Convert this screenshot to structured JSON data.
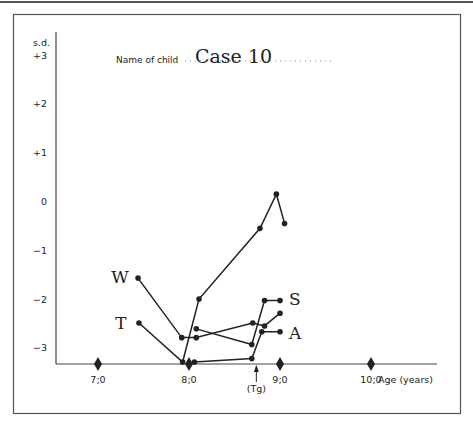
{
  "header": {
    "name_label": "Name of child",
    "name_value": "Case 10"
  },
  "colors": {
    "ink": "#222222",
    "frame": "#555555",
    "background": "#ffffff"
  },
  "chart_data": {
    "type": "line",
    "xlabel": "Age (years)",
    "ylabel": "s.d.",
    "x_ticks": [
      {
        "value": 7.0,
        "label": "7;0"
      },
      {
        "value": 8.0,
        "label": "8;0"
      },
      {
        "value": 9.0,
        "label": "9;0"
      },
      {
        "value": 10.0,
        "label": "10;0"
      }
    ],
    "y_ticks": [
      {
        "value": 3,
        "label": "+3"
      },
      {
        "value": 2,
        "label": "+2"
      },
      {
        "value": 1,
        "label": "+1"
      },
      {
        "value": 0,
        "label": "0"
      },
      {
        "value": -1,
        "label": "-1"
      },
      {
        "value": -2,
        "label": "-2"
      },
      {
        "value": -3,
        "label": "-3"
      }
    ],
    "xlim": [
      6.53,
      10.74
    ],
    "ylim": [
      -3.35,
      3.4
    ],
    "grid": false,
    "annotations": [
      {
        "text": "(Tg)",
        "x": 8.74,
        "type": "arrow-up"
      }
    ],
    "series": [
      {
        "name": "W",
        "label_pos": [
          7.3,
          -1.55
        ],
        "points": [
          [
            7.44,
            -1.58
          ],
          [
            7.92,
            -2.8
          ],
          [
            8.08,
            -2.8
          ],
          [
            8.7,
            -2.5
          ],
          [
            8.83,
            -2.56
          ],
          [
            9.0,
            -2.3
          ]
        ]
      },
      {
        "name": "T",
        "label_pos": [
          7.3,
          -2.5
        ],
        "points": [
          [
            7.45,
            -2.5
          ],
          [
            7.93,
            -3.3
          ],
          [
            8.11,
            -2.01
          ],
          [
            8.78,
            -0.56
          ],
          [
            8.96,
            0.14
          ],
          [
            9.05,
            -0.46
          ]
        ]
      },
      {
        "name": "S",
        "label_pos": [
          9.1,
          -2.0
        ],
        "points": [
          [
            8.08,
            -2.62
          ],
          [
            8.69,
            -2.94
          ],
          [
            8.83,
            -2.04
          ],
          [
            9.0,
            -2.04
          ]
        ]
      },
      {
        "name": "A",
        "label_pos": [
          9.1,
          -2.7
        ],
        "points": [
          [
            8.06,
            -3.3
          ],
          [
            8.69,
            -3.23
          ],
          [
            8.8,
            -2.68
          ],
          [
            9.0,
            -2.68
          ]
        ]
      }
    ]
  }
}
